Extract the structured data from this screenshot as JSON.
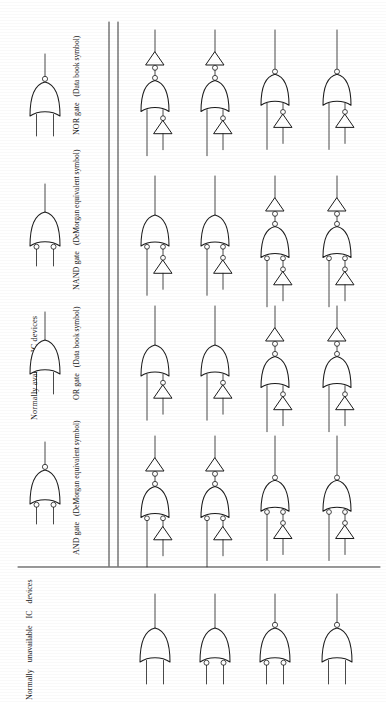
{
  "figure": {
    "orientation": "page rotated 90 degrees counter-clockwise",
    "background_color": "#ffffff",
    "ink_color": "#1c1c1c"
  },
  "sections": {
    "available": {
      "label": "Normally available IC devices",
      "gates": [
        {
          "name": "AND gate",
          "sub": "(DeMorgan equivalent symbol)",
          "shape": "or-body",
          "out_bubble": true,
          "in_bubbles": true
        },
        {
          "name": "OR gate",
          "sub": "(Data book symbol)",
          "shape": "or-body",
          "out_bubble": false,
          "in_bubbles": false
        },
        {
          "name": "NAND gate",
          "sub": "(DeMorgan equivalent symbol)",
          "shape": "or-body",
          "out_bubble": false,
          "in_bubbles": true
        },
        {
          "name": "NOR gate",
          "sub": "(Data book symbol)",
          "shape": "or-body",
          "out_bubble": true,
          "in_bubbles": false
        }
      ]
    },
    "unavailable": {
      "label_lines": [
        "Normally",
        "unavailable",
        "IC",
        "devices"
      ],
      "label": "Normally unavailable IC devices",
      "gates": [
        {
          "name": "gate-a",
          "shape": "or-body",
          "out_bubble": false,
          "in_bubbles": false
        },
        {
          "name": "gate-b",
          "shape": "or-body",
          "out_bubble": false,
          "in_bubbles": true
        },
        {
          "name": "gate-c",
          "shape": "or-body",
          "out_bubble": true,
          "in_bubbles": true
        },
        {
          "name": "gate-d",
          "shape": "or-body",
          "out_bubble": true,
          "in_bubbles": false
        }
      ]
    }
  },
  "grid": {
    "rows": [
      {
        "row_name": "AND gate",
        "cells": [
          {
            "out_inverter": true,
            "out_bubble": true,
            "in_bubbles": true,
            "in_inverter": true,
            "in_inverter_bubble": false
          },
          {
            "out_inverter": true,
            "out_bubble": true,
            "in_bubbles": true,
            "in_inverter": true,
            "in_inverter_bubble": false
          },
          {
            "out_inverter": false,
            "out_bubble": true,
            "in_bubbles": true,
            "in_inverter": true,
            "in_inverter_bubble": true
          },
          {
            "out_inverter": false,
            "out_bubble": true,
            "in_bubbles": true,
            "in_inverter": true,
            "in_inverter_bubble": true
          }
        ]
      },
      {
        "row_name": "OR gate",
        "cells": [
          {
            "out_inverter": false,
            "out_bubble": false,
            "in_bubbles": false,
            "in_inverter": true,
            "in_inverter_bubble": true
          },
          {
            "out_inverter": false,
            "out_bubble": false,
            "in_bubbles": false,
            "in_inverter": true,
            "in_inverter_bubble": true
          },
          {
            "out_inverter": true,
            "out_bubble": true,
            "in_bubbles": false,
            "in_inverter": true,
            "in_inverter_bubble": true
          },
          {
            "out_inverter": true,
            "out_bubble": true,
            "in_bubbles": false,
            "in_inverter": true,
            "in_inverter_bubble": true
          }
        ]
      },
      {
        "row_name": "NAND gate",
        "cells": [
          {
            "out_inverter": false,
            "out_bubble": false,
            "in_bubbles": true,
            "in_inverter": true,
            "in_inverter_bubble": true
          },
          {
            "out_inverter": false,
            "out_bubble": false,
            "in_bubbles": true,
            "in_inverter": true,
            "in_inverter_bubble": true
          },
          {
            "out_inverter": true,
            "out_bubble": true,
            "in_bubbles": true,
            "in_inverter": true,
            "in_inverter_bubble": true
          },
          {
            "out_inverter": true,
            "out_bubble": true,
            "in_bubbles": true,
            "in_inverter": true,
            "in_inverter_bubble": true
          }
        ]
      },
      {
        "row_name": "NOR gate",
        "cells": [
          {
            "out_inverter": true,
            "out_bubble": true,
            "in_bubbles": false,
            "in_inverter": true,
            "in_inverter_bubble": true
          },
          {
            "out_inverter": true,
            "out_bubble": true,
            "in_bubbles": false,
            "in_inverter": true,
            "in_inverter_bubble": true
          },
          {
            "out_inverter": false,
            "out_bubble": true,
            "in_bubbles": false,
            "in_inverter": true,
            "in_inverter_bubble": true
          },
          {
            "out_inverter": false,
            "out_bubble": true,
            "in_bubbles": false,
            "in_inverter": true,
            "in_inverter_bubble": true
          }
        ]
      }
    ]
  },
  "rules": {
    "divider_x_outer": 109,
    "divider_x_inner": 118,
    "separator_y": 567
  }
}
